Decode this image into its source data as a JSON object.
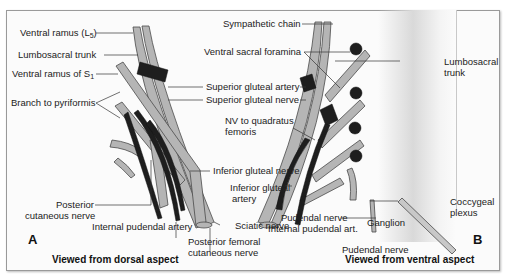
{
  "figure": {
    "panel_a": {
      "letter": "A",
      "caption": "Viewed from dorsal aspect",
      "labels": {
        "ventral_ramus_l5_prefix": "Ventral ramus (L",
        "ventral_ramus_l5_sub": "5",
        "ventral_ramus_l5_suffix": ")",
        "lumbosacral_trunk": "Lumbosacral trunk",
        "ventral_ramus_s1_prefix": "Ventral ramus of S",
        "ventral_ramus_s1_sub": "1",
        "branch_to_pyriformis": "Branch to pyriformis",
        "superior_gluteal_artery": "Superior gluteal artery",
        "superior_gluteal_nerve": "Superior gluteal nerve",
        "inferior_gluteal_nerve": "Inferior gluteal nerve",
        "inferior_gluteal_artery_1": "Inferior gluteal",
        "inferior_gluteal_artery_2": "artery",
        "sciatic_nerve": "Sciatic nerve",
        "posterior_cutaneous_nerve_1": "Posterior",
        "posterior_cutaneous_nerve_2": "cutaneous nerve",
        "internal_pudendal_artery": "Internal pudendal artery",
        "posterior_femoral_cutaneous_1": "Posterior femoral",
        "posterior_femoral_cutaneous_2": "cutaneous nerve"
      }
    },
    "panel_b": {
      "letter": "B",
      "caption": "Viewed from ventral aspect",
      "labels": {
        "sympathetic_chain": "Sympathetic chain",
        "ventral_sacral_foramina": "Ventral sacral foramina",
        "nv_quadratus_1": "NV to quadratus",
        "nv_quadratus_2": "femoris",
        "lumbosacral_trunk_1": "Lumbosacral",
        "lumbosacral_trunk_2": "trunk",
        "pudendal_nerve_1": "Pudendal nerve",
        "internal_pudendal_art": "Internal pudendal art.",
        "pudendal_nerve_2": "Pudendal nerve",
        "ganglion": "Ganglion",
        "coccygeal_plexus_1": "Coccygeal",
        "coccygeal_plexus_2": "plexus"
      }
    },
    "colors": {
      "nerve_fill": "#b5b5b5",
      "nerve_stroke": "#4a4a4a",
      "artery_fill": "#1e1e1e",
      "leader_line": "#333333"
    }
  }
}
